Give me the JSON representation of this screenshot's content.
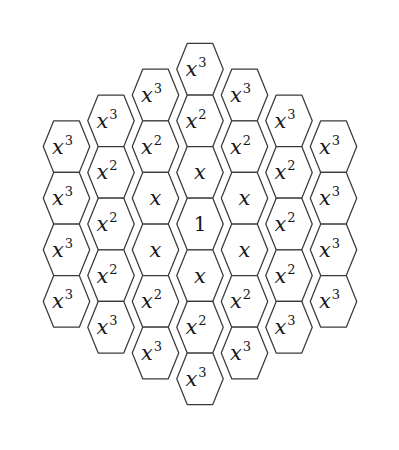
{
  "figure": {
    "name": "hexagonal-weight-diagram",
    "background_color": "#ffffff",
    "stroke_color": "#3a3a3c",
    "text_color": "#17171a",
    "width": 399,
    "height": 450
  },
  "geometry": {
    "center_x": 200,
    "center_y": 224,
    "column_pitch": 44.5,
    "row_pitch": 51.6,
    "hex_radius": 29.8,
    "columns": 7,
    "rings": 3
  },
  "legend": {
    "center_value": "1",
    "ring1_value": "x",
    "ring2_value": "x2",
    "ring3_value": "x3"
  },
  "chart_data": {
    "type": "diagram",
    "title": "",
    "subtitle": "",
    "xlabel": "",
    "ylabel": "",
    "columns": [
      {
        "index": 0,
        "cells": [
          {
            "base": "x",
            "exp": "3",
            "ring": 3
          },
          {
            "base": "x",
            "exp": "3",
            "ring": 3
          },
          {
            "base": "x",
            "exp": "3",
            "ring": 3
          },
          {
            "base": "x",
            "exp": "3",
            "ring": 3
          }
        ]
      },
      {
        "index": 1,
        "cells": [
          {
            "base": "x",
            "exp": "3",
            "ring": 3
          },
          {
            "base": "x",
            "exp": "2",
            "ring": 2
          },
          {
            "base": "x",
            "exp": "2",
            "ring": 2
          },
          {
            "base": "x",
            "exp": "2",
            "ring": 2
          },
          {
            "base": "x",
            "exp": "3",
            "ring": 3
          }
        ]
      },
      {
        "index": 2,
        "cells": [
          {
            "base": "x",
            "exp": "3",
            "ring": 3
          },
          {
            "base": "x",
            "exp": "2",
            "ring": 2
          },
          {
            "base": "x",
            "exp": "",
            "ring": 1
          },
          {
            "base": "x",
            "exp": "",
            "ring": 1
          },
          {
            "base": "x",
            "exp": "2",
            "ring": 2
          },
          {
            "base": "x",
            "exp": "3",
            "ring": 3
          }
        ]
      },
      {
        "index": 3,
        "cells": [
          {
            "base": "x",
            "exp": "3",
            "ring": 3
          },
          {
            "base": "x",
            "exp": "2",
            "ring": 2
          },
          {
            "base": "x",
            "exp": "",
            "ring": 1
          },
          {
            "base": "1",
            "exp": "",
            "ring": 0
          },
          {
            "base": "x",
            "exp": "",
            "ring": 1
          },
          {
            "base": "x",
            "exp": "2",
            "ring": 2
          },
          {
            "base": "x",
            "exp": "3",
            "ring": 3
          }
        ]
      },
      {
        "index": 4,
        "cells": [
          {
            "base": "x",
            "exp": "3",
            "ring": 3
          },
          {
            "base": "x",
            "exp": "2",
            "ring": 2
          },
          {
            "base": "x",
            "exp": "",
            "ring": 1
          },
          {
            "base": "x",
            "exp": "",
            "ring": 1
          },
          {
            "base": "x",
            "exp": "2",
            "ring": 2
          },
          {
            "base": "x",
            "exp": "3",
            "ring": 3
          }
        ]
      },
      {
        "index": 5,
        "cells": [
          {
            "base": "x",
            "exp": "3",
            "ring": 3
          },
          {
            "base": "x",
            "exp": "2",
            "ring": 2
          },
          {
            "base": "x",
            "exp": "2",
            "ring": 2
          },
          {
            "base": "x",
            "exp": "2",
            "ring": 2
          },
          {
            "base": "x",
            "exp": "3",
            "ring": 3
          }
        ]
      },
      {
        "index": 6,
        "cells": [
          {
            "base": "x",
            "exp": "3",
            "ring": 3
          },
          {
            "base": "x",
            "exp": "3",
            "ring": 3
          },
          {
            "base": "x",
            "exp": "3",
            "ring": 3
          },
          {
            "base": "x",
            "exp": "3",
            "ring": 3
          }
        ]
      }
    ],
    "total_cells": 37,
    "ring_counts": {
      "0": 1,
      "1": 6,
      "2": 12,
      "3": 18
    }
  }
}
